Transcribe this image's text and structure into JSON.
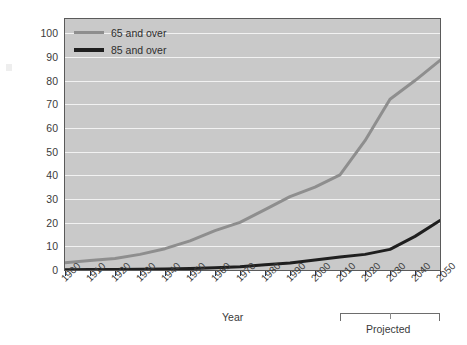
{
  "chart_data": {
    "type": "line",
    "title": "",
    "xlabel": "Year",
    "ylabel": "People (millions)",
    "x": [
      1900,
      1910,
      1920,
      1930,
      1940,
      1950,
      1960,
      1970,
      1980,
      1990,
      2000,
      2010,
      2020,
      2030,
      2040,
      2050
    ],
    "xtick_labels": [
      "1900",
      "1910",
      "1920",
      "1930",
      "1940",
      "1950",
      "1960",
      "1970",
      "1980",
      "1990",
      "2000",
      "2010",
      "2020",
      "2030",
      "2040",
      "2050"
    ],
    "ytick_labels": [
      "0",
      "10",
      "20",
      "30",
      "40",
      "50",
      "60",
      "70",
      "80",
      "90",
      "100"
    ],
    "ytick_values": [
      0,
      10,
      20,
      30,
      40,
      50,
      60,
      70,
      80,
      90,
      100
    ],
    "xlim": [
      1900,
      2050
    ],
    "ylim": [
      0,
      106
    ],
    "grid": true,
    "legend_position": "top-left",
    "series": [
      {
        "name": "65 and over",
        "color": "#8e8e8e",
        "width": 3,
        "values": [
          3.1,
          4.0,
          4.9,
          6.6,
          9.0,
          12.3,
          16.6,
          20.1,
          25.5,
          31.0,
          35.0,
          40.2,
          54.6,
          72.1,
          80.0,
          88.5
        ]
      },
      {
        "name": "85 and over",
        "color": "#1f1f1f",
        "width": 3,
        "values": [
          0.1,
          0.2,
          0.2,
          0.3,
          0.4,
          0.6,
          0.9,
          1.4,
          2.2,
          3.0,
          4.2,
          5.5,
          6.6,
          8.7,
          14.2,
          20.9
        ]
      }
    ],
    "annotations": [
      {
        "name": "projected-bracket",
        "label": "Projected",
        "x_start": 2010,
        "x_end": 2050,
        "x_tick": 2030
      }
    ]
  },
  "legend": {
    "items": [
      {
        "label": "65 and over",
        "color": "#8e8e8e"
      },
      {
        "label": "85 and over",
        "color": "#1f1f1f"
      }
    ]
  },
  "axes": {
    "y_title": "People (millions)",
    "x_title": "Year"
  },
  "colors": {
    "plot_background": "#c9c9c9",
    "gridline": "#f2f2f2",
    "frame": "#5a5a5a",
    "series_65": "#8e8e8e",
    "series_85": "#1f1f1f",
    "text": "#3a3a3a"
  }
}
